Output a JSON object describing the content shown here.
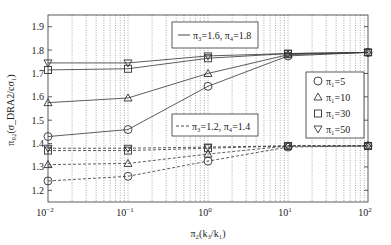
{
  "chart_data": {
    "type": "line",
    "title": "",
    "xlabel": "π2(k3/k1)",
    "ylabel": "π02(σDRA2/cσ1)",
    "xscale": "log",
    "xlim": [
      0.01,
      100
    ],
    "ylim": [
      1.15,
      1.95
    ],
    "x_ticks": [
      "10^-2",
      "10^-1",
      "10^0",
      "10^1",
      "10^2"
    ],
    "y_ticks": [
      "1.2",
      "1.3",
      "1.4",
      "1.5",
      "1.6",
      "1.7",
      "1.8",
      "1.9"
    ],
    "grid": "x-minor-dotted",
    "x": [
      0.01,
      0.1,
      1,
      10,
      100
    ],
    "line_style_legend": [
      {
        "style": "solid",
        "label": "π3=1.6, π4=1.8"
      },
      {
        "style": "dashed",
        "label": "π3=1.2, π4=1.4"
      }
    ],
    "marker_legend": [
      {
        "marker": "circle",
        "label": "π1=5"
      },
      {
        "marker": "triangle-up",
        "label": "π1=10"
      },
      {
        "marker": "square",
        "label": "π1=30"
      },
      {
        "marker": "triangle-down",
        "label": "π1=50"
      }
    ],
    "series": [
      {
        "name": "π1=5, π3=1.6, π4=1.8",
        "marker": "circle",
        "style": "solid",
        "values": [
          1.43,
          1.46,
          1.645,
          1.775,
          1.79
        ]
      },
      {
        "name": "π1=10, π3=1.6, π4=1.8",
        "marker": "triangle-up",
        "style": "solid",
        "values": [
          1.575,
          1.595,
          1.7,
          1.78,
          1.79
        ]
      },
      {
        "name": "π1=30, π3=1.6, π4=1.8",
        "marker": "square",
        "style": "solid",
        "values": [
          1.715,
          1.72,
          1.765,
          1.785,
          1.79
        ]
      },
      {
        "name": "π1=50, π3=1.6, π4=1.8",
        "marker": "triangle-down",
        "style": "solid",
        "values": [
          1.745,
          1.745,
          1.775,
          1.785,
          1.79
        ]
      },
      {
        "name": "π1=5, π3=1.2, π4=1.4",
        "marker": "circle",
        "style": "dashed",
        "values": [
          1.24,
          1.26,
          1.325,
          1.385,
          1.39
        ]
      },
      {
        "name": "π1=10, π3=1.2, π4=1.4",
        "marker": "triangle-up",
        "style": "dashed",
        "values": [
          1.31,
          1.315,
          1.355,
          1.39,
          1.39
        ]
      },
      {
        "name": "π1=30, π3=1.2, π4=1.4",
        "marker": "square",
        "style": "dashed",
        "values": [
          1.37,
          1.37,
          1.38,
          1.39,
          1.39
        ]
      },
      {
        "name": "π1=50, π3=1.2, π4=1.4",
        "marker": "triangle-down",
        "style": "dashed",
        "values": [
          1.38,
          1.38,
          1.385,
          1.39,
          1.39
        ]
      }
    ]
  },
  "labels": {
    "legend_solid": "π₃=1.6, π₄=1.8",
    "legend_dashed": "π₃=1.2, π₄=1.4",
    "legend_m1": "π₁=5",
    "legend_m2": "π₁=10",
    "legend_m3": "π₁=30",
    "legend_m4": "π₁=50",
    "xlabel": "π₂(k₃/k₁)",
    "ylabel": "π₀₂(σ_DRA2/cσ₁)"
  }
}
